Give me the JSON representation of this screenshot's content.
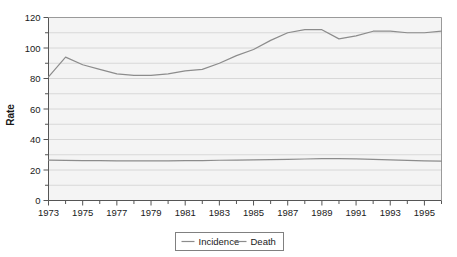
{
  "chart_data": {
    "type": "line",
    "title": "",
    "xlabel": "",
    "ylabel": "Rate",
    "xlim": [
      1973,
      1996
    ],
    "ylim": [
      0,
      120
    ],
    "ytick_step": 20,
    "yticks": [
      0,
      20,
      40,
      60,
      80,
      100,
      120
    ],
    "ytick_labels": [
      "0",
      "20",
      "40",
      "60",
      "80",
      "100",
      "120"
    ],
    "xticks": [
      1973,
      1975,
      1977,
      1979,
      1981,
      1983,
      1985,
      1987,
      1989,
      1991,
      1993,
      1995
    ],
    "xtick_labels": [
      "1973",
      "1975",
      "1977",
      "1979",
      "1981",
      "1983",
      "1985",
      "1987",
      "1989",
      "1991",
      "1993",
      "1995"
    ],
    "minor_xticks": [
      1974,
      1976,
      1978,
      1980,
      1982,
      1984,
      1986,
      1988,
      1990,
      1992,
      1994,
      1996
    ],
    "minor_ytick_step": 10,
    "grid": "horizontal",
    "legend_position": "bottom-center",
    "x": [
      1973,
      1974,
      1975,
      1976,
      1977,
      1978,
      1979,
      1980,
      1981,
      1982,
      1983,
      1984,
      1985,
      1986,
      1987,
      1988,
      1989,
      1990,
      1991,
      1992,
      1993,
      1994,
      1995,
      1996
    ],
    "series": [
      {
        "name": "Incidence",
        "color": "#8c8c8c",
        "values": [
          81,
          94,
          89,
          86,
          83,
          82,
          82,
          83,
          85,
          86,
          90,
          95,
          99,
          105,
          110,
          112,
          112,
          106,
          108,
          111,
          111,
          110,
          110,
          111
        ]
      },
      {
        "name": "Death",
        "color": "#8c8c8c",
        "values": [
          26.5,
          26.3,
          26.2,
          26.1,
          26.0,
          26.0,
          26.0,
          26.0,
          26.1,
          26.2,
          26.4,
          26.5,
          26.6,
          26.8,
          27.0,
          27.2,
          27.4,
          27.5,
          27.3,
          27.0,
          26.6,
          26.3,
          26.0,
          25.8
        ]
      }
    ]
  },
  "legend": {
    "items": [
      {
        "label": "Incidence"
      },
      {
        "label": "Death"
      }
    ]
  },
  "colors": {
    "line": "#8c8c8c",
    "plot_background": "#f4f4f4",
    "grid": "#d0d0d0",
    "axis": "#555555",
    "text": "#1a1a1a",
    "legend_border": "#808080"
  }
}
